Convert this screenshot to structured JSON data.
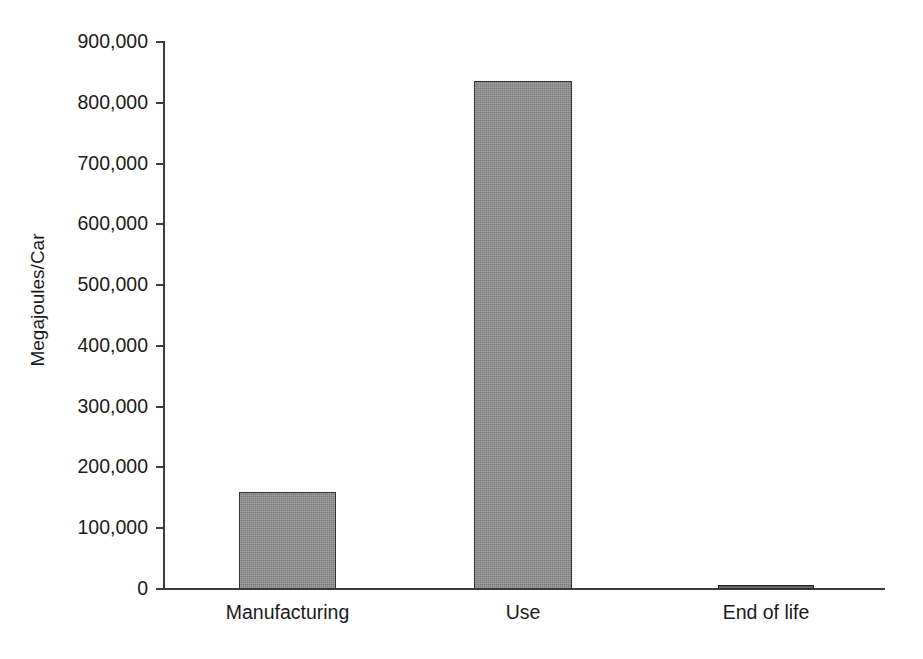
{
  "chart_data": {
    "type": "bar",
    "title": "",
    "subtitle": "",
    "xlabel": "",
    "ylabel": "Megajoules/Car",
    "categories": [
      "Manufacturing",
      "Use",
      "End of life"
    ],
    "values": [
      160000,
      836000,
      7000
    ],
    "ylim": [
      0,
      900000
    ],
    "ytick_values": [
      0,
      100000,
      200000,
      300000,
      400000,
      500000,
      600000,
      700000,
      800000,
      900000
    ],
    "ytick_labels": [
      "0",
      "100,000",
      "200,000",
      "300,000",
      "400,000",
      "500,000",
      "600,000",
      "700,000",
      "800,000",
      "900,000"
    ],
    "grid": false,
    "legend": false,
    "legend_position": "none",
    "bar_color": "#8d8d8d",
    "bar_edge_color": "#333333",
    "axis_color": "#3b3b3b",
    "background_color": "#ffffff",
    "series": [
      {
        "name": "Energy per car",
        "values": [
          160000,
          836000,
          7000
        ]
      }
    ],
    "annotations": []
  }
}
